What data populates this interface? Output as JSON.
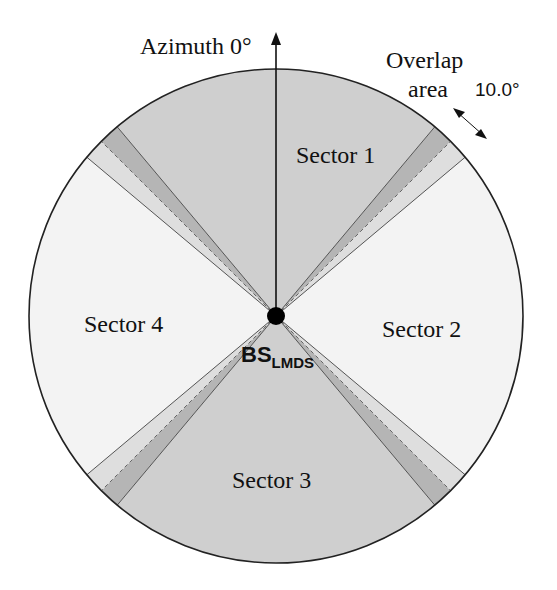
{
  "diagram": {
    "azimuth_label": "Azimuth 0°",
    "overlap_label_line1": "Overlap",
    "overlap_label_line2": "area",
    "overlap_angle": "10.0°",
    "base_station": {
      "label_main": "BS",
      "label_sub": "LMDS"
    },
    "sectors": [
      {
        "id": 1,
        "label": "Sector 1",
        "azimuth_start": 320,
        "azimuth_end": 40,
        "color": "#cfcfcf"
      },
      {
        "id": 2,
        "label": "Sector 2",
        "azimuth_start": 50,
        "azimuth_end": 130,
        "color": "#f3f3f3"
      },
      {
        "id": 3,
        "label": "Sector 3",
        "azimuth_start": 140,
        "azimuth_end": 220,
        "color": "#cfcfcf"
      },
      {
        "id": 4,
        "label": "Sector 4",
        "azimuth_start": 230,
        "azimuth_end": 310,
        "color": "#f3f3f3"
      }
    ],
    "overlap_areas": [
      {
        "from": 40,
        "to": 50,
        "dashed_at": 45
      },
      {
        "from": 130,
        "to": 140,
        "dashed_at": 135
      },
      {
        "from": 220,
        "to": 230,
        "dashed_at": 225
      },
      {
        "from": 310,
        "to": 320,
        "dashed_at": 315
      }
    ],
    "colors": {
      "gray_sector": "#cfcfcf",
      "light_sector": "#f3f3f3",
      "overlap_dark": "#b5b5b5",
      "overlap_light": "#dedede",
      "outline": "#222222"
    }
  }
}
